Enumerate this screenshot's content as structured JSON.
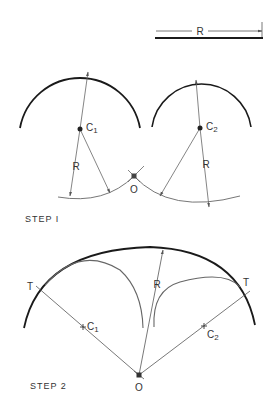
{
  "figure": {
    "dimension": {
      "label": "R"
    },
    "step1": {
      "title": "STEP I",
      "center1_label": "C",
      "center1_sub": "1",
      "center2_label": "C",
      "center2_sub": "2",
      "radius_label_left": "R",
      "radius_label_right": "R",
      "intersection_label": "O"
    },
    "step2": {
      "title": "STEP 2",
      "tangent_left_label": "T",
      "tangent_right_label": "T",
      "center1_label": "C",
      "center1_sub": "1",
      "center2_label": "C",
      "center2_sub": "2",
      "radius_label": "R",
      "center_label": "O"
    },
    "colors": {
      "heavy_line": "#1a1a1a",
      "thin_line": "#6e6e6e",
      "text": "#333333"
    }
  }
}
